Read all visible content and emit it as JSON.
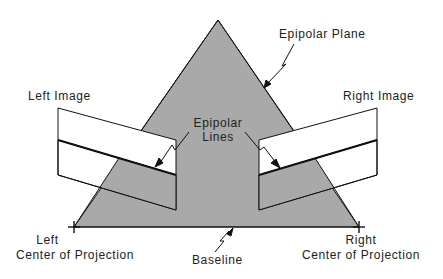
{
  "labels": {
    "epipolar_plane": "Epipolar Plane",
    "left_image": "Left Image",
    "right_image": "Right Image",
    "epipolar_lines_1": "Epipolar",
    "epipolar_lines_2": "Lines",
    "left_cop_1": "Left",
    "left_cop_2": "Center  of  Projection",
    "right_cop_1": "Right",
    "right_cop_2": "Center  of  Projection",
    "baseline": "Baseline"
  },
  "colors": {
    "plane_fill": "#a9a9a9",
    "line": "#111111",
    "image_fill": "#ffffff"
  }
}
